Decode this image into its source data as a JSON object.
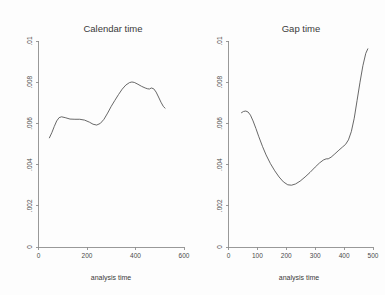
{
  "figure": {
    "background_color": "#fdfdfd",
    "axis_color": "#8e8e8e",
    "curve_color": "#4d4d4d",
    "panels": 2
  },
  "chart_data": [
    {
      "type": "line",
      "panel": "left",
      "title": "Calendar time",
      "xlabel": "analysis time",
      "ylabel": "",
      "xlim": [
        0,
        600
      ],
      "ylim": [
        0,
        0.01
      ],
      "xticks": [
        0,
        200,
        400,
        600
      ],
      "xticklabels": [
        "0",
        "200",
        "400",
        "600"
      ],
      "yticks": [
        0,
        0.002,
        0.004,
        0.006,
        0.008,
        0.01
      ],
      "yticklabels": [
        "0",
        ".002",
        ".004",
        ".006",
        ".008",
        ".01"
      ],
      "grid": false,
      "legend": "none",
      "series": [
        {
          "name": "smoothed hazard",
          "x": [
            45,
            55,
            65,
            75,
            85,
            95,
            110,
            130,
            150,
            170,
            190,
            210,
            225,
            240,
            255,
            270,
            285,
            300,
            315,
            330,
            345,
            360,
            375,
            385,
            395,
            410,
            425,
            440,
            450,
            458,
            465,
            475,
            485,
            495,
            505,
            515,
            522
          ],
          "y": [
            0.0053,
            0.00555,
            0.00585,
            0.00612,
            0.00628,
            0.00632,
            0.00628,
            0.00621,
            0.0062,
            0.0062,
            0.00616,
            0.00606,
            0.00596,
            0.00592,
            0.006,
            0.0062,
            0.0065,
            0.00683,
            0.00712,
            0.0074,
            0.00766,
            0.00786,
            0.00798,
            0.00801,
            0.00799,
            0.0079,
            0.0078,
            0.00772,
            0.00768,
            0.00767,
            0.00772,
            0.00768,
            0.00752,
            0.00728,
            0.00703,
            0.00682,
            0.00674
          ]
        }
      ]
    },
    {
      "type": "line",
      "panel": "right",
      "title": "Gap time",
      "xlabel": "analysis time",
      "ylabel": "",
      "xlim": [
        0,
        500
      ],
      "ylim": [
        0,
        0.01
      ],
      "xticks": [
        0,
        100,
        200,
        300,
        400,
        500
      ],
      "xticklabels": [
        "0",
        "100",
        "200",
        "300",
        "400",
        "500"
      ],
      "yticks": [
        0,
        0.002,
        0.004,
        0.006,
        0.008,
        0.01
      ],
      "yticklabels": [
        "0",
        ".002",
        ".004",
        ".006",
        ".008",
        ".01"
      ],
      "grid": false,
      "legend": "none",
      "series": [
        {
          "name": "smoothed hazard",
          "x": [
            45,
            52,
            60,
            68,
            76,
            85,
            95,
            105,
            118,
            130,
            145,
            160,
            175,
            190,
            205,
            218,
            232,
            248,
            265,
            282,
            300,
            315,
            328,
            338,
            345,
            355,
            368,
            382,
            395,
            405,
            415,
            425,
            435,
            445,
            455,
            465,
            475,
            482
          ],
          "y": [
            0.00652,
            0.00658,
            0.0066,
            0.00655,
            0.0064,
            0.00612,
            0.00575,
            0.00535,
            0.00487,
            0.00447,
            0.00405,
            0.0037,
            0.0034,
            0.00316,
            0.00302,
            0.003,
            0.00306,
            0.0032,
            0.0034,
            0.00362,
            0.00388,
            0.00408,
            0.00422,
            0.00428,
            0.00428,
            0.00436,
            0.00452,
            0.0047,
            0.00486,
            0.00498,
            0.0052,
            0.0056,
            0.00625,
            0.00712,
            0.008,
            0.0088,
            0.0094,
            0.00962
          ]
        }
      ]
    }
  ]
}
